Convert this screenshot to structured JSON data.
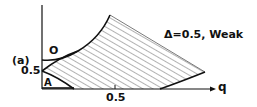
{
  "panel_label": "(a)",
  "title": "Δ=0.5, Weak",
  "x_axis_label": "q",
  "x_tick": "0.5",
  "y_tick": "0.5",
  "region_labels": {
    "upper": "O",
    "lower": "A"
  },
  "colors": {
    "ink": "#111111",
    "background": "#ffffff"
  }
}
